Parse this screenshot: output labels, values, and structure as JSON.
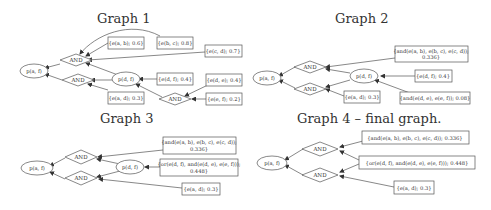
{
  "graphs": [
    {
      "title": "Graph 1",
      "nodes": {
        "root": "p(a, f)",
        "mid": "p(d, f)",
        "and1": "AND",
        "and2": "AND",
        "and3": "AND",
        "e_ab": "{e(a, b); 0.6}",
        "e_bc": "{e(b, c); 0.8}",
        "e_cd": "{e(c, d); 0.7}",
        "e_df": "{e(d, f); 0.4}",
        "e_de": "{e(d, e); 0.4}",
        "e_ef": "{e(e, f); 0.2}",
        "e_ad": "{e(a, d); 0.3}"
      }
    },
    {
      "title": "Graph 2",
      "nodes": {
        "root": "p(a, f)",
        "mid": "p(d, f)",
        "and1": "AND",
        "and2": "AND",
        "and_abcd_l1": "{and(e(a, b), e(b, c), e(c, d));",
        "and_abcd_l2": "0.336}",
        "e_df": "{e(d, f); 0.4}",
        "and_def": "{and(e(d, e), e(e, f)); 0.08}",
        "e_ad": "{e(a, d); 0.3}"
      }
    },
    {
      "title": "Graph 3",
      "nodes": {
        "root": "p(a, f)",
        "mid": "p(d, f)",
        "and1": "AND",
        "and2": "AND",
        "and_abcd_l1": "{and(e(a, b), e(b, c), e(c, d));",
        "and_abcd_l2": "0.336}",
        "or_df_l1": "{or(e(d, f), and(e(d, e), e(e, f)));",
        "or_df_l2": "0.448}",
        "e_ad": "{e(a, d); 0.3}"
      }
    },
    {
      "title": "Graph 4 – final graph.",
      "nodes": {
        "root": "p(a, f)",
        "and1": "AND",
        "and2": "AND",
        "and_abcd": "{and(e(a, b), e(b, c), e(c, d)); 0.336}",
        "or_df": "{or(e(d, f), and(e(d, e), e(e, f))); 0.448}",
        "e_ad": "{e(a, d); 0.3}"
      }
    }
  ],
  "colors": {
    "stroke": "#555555",
    "text": "#333333",
    "background": "#ffffff"
  }
}
